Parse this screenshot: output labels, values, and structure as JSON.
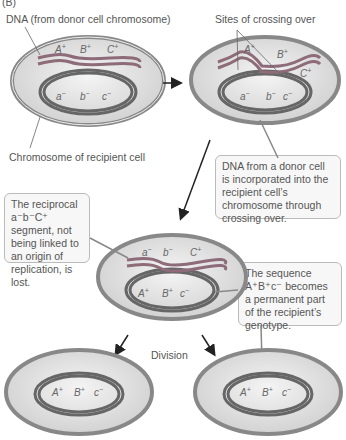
{
  "panel_label": "(B)",
  "labels": {
    "donor_dna": "DNA (from donor cell chromosome)",
    "crossing_sites": "Sites of crossing over",
    "recipient_chromosome": "Chromosome of recipient cell",
    "division": "Division"
  },
  "callouts": {
    "incorporation": "DNA from a donor cell is incorporated into the recipient cell’s chromosome through crossing over.",
    "lost_segment": "The reciprocal a⁻b⁻C⁺ segment, not being linked to an origin of replication, is lost.",
    "permanent": "The sequence A⁺B⁺c⁻ becomes a permanent part of the recipient’s genotype."
  },
  "genes": {
    "donor": [
      "A+",
      "B+",
      "C+"
    ],
    "recipient": [
      "a−",
      "b−",
      "c−"
    ],
    "recombinant": [
      "A+",
      "B+",
      "c−"
    ],
    "lost": [
      "a−",
      "b−",
      "C+"
    ]
  },
  "colors": {
    "membrane": "#8a8a8a",
    "cytoplasm": "#e6e6e6",
    "donor_strand": "#9a6a7a",
    "recipient_strand": "#3a3a3a",
    "gene_band": "#222222"
  }
}
